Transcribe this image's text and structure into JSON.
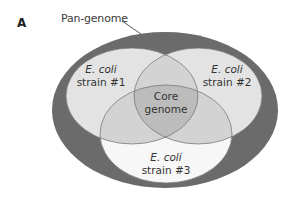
{
  "figure": {
    "panel_label": "A",
    "pan_genome_label": "Pan-genome",
    "core_label_line1": "Core",
    "core_label_line2": "genome",
    "strains": [
      {
        "species": "E. coli",
        "strain": "strain #1"
      },
      {
        "species": "E. coli",
        "strain": "strain #2"
      },
      {
        "species": "E. coli",
        "strain": "strain #3"
      }
    ],
    "colors": {
      "pan_genome_ring": "#6b6b6b",
      "single_strain": "#e3e3e3",
      "strain3_only": "#f7f7f7",
      "pairwise_overlap": "#d3d3d3",
      "core": "#bcbcbc",
      "outline": "#7a7a7a"
    }
  }
}
